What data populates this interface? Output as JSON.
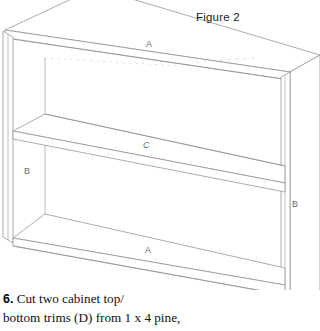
{
  "figure": {
    "title": "Figure 2",
    "type": "isometric-line-drawing",
    "labels": [
      {
        "id": "a-top",
        "text": "A"
      },
      {
        "id": "c",
        "text": "C"
      },
      {
        "id": "b-left",
        "text": "B"
      },
      {
        "id": "b-right",
        "text": "B"
      },
      {
        "id": "a-bot",
        "text": "A"
      }
    ],
    "line_color": "#8a8a8a",
    "fill_color": "#ffffff",
    "background_color": "#ffffff"
  },
  "caption": {
    "step_number": "6.",
    "line1": "Cut two cabinet top/",
    "line2": "bottom trims (D) from 1 x 4 pine,"
  }
}
